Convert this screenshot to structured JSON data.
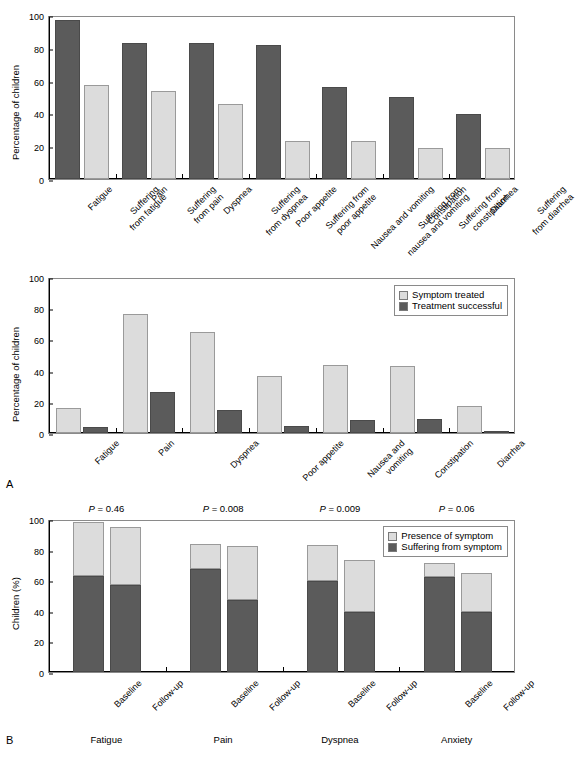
{
  "figure": {
    "panel_a_letter": "A",
    "panel_b_letter": "B"
  },
  "chart_data": [
    {
      "id": "chart-top",
      "type": "bar",
      "title": "",
      "xlabel": "",
      "ylabel": "Percentage of children",
      "ylim": [
        0,
        100
      ],
      "yticks": [
        0,
        20,
        40,
        60,
        80,
        100
      ],
      "grid": false,
      "legend": "none",
      "groups": [
        {
          "name": "Fatigue",
          "bars": [
            {
              "label": "Fatigue",
              "value": 97,
              "style": "dark"
            },
            {
              "label": "Suffering\nfrom fatigue",
              "value": 57.5,
              "style": "light"
            }
          ]
        },
        {
          "name": "Pain",
          "bars": [
            {
              "label": "Pain",
              "value": 83,
              "style": "dark"
            },
            {
              "label": "Suffering\nfrom pain",
              "value": 53.5,
              "style": "light"
            }
          ]
        },
        {
          "name": "Dyspnea",
          "bars": [
            {
              "label": "Dyspnea",
              "value": 83,
              "style": "dark"
            },
            {
              "label": "Suffering\nfrom dyspnea",
              "value": 46,
              "style": "light"
            }
          ]
        },
        {
          "name": "Poor appetite",
          "bars": [
            {
              "label": "Poor appetite",
              "value": 82,
              "style": "dark"
            },
            {
              "label": "Suffering from\npoor appetite",
              "value": 23,
              "style": "light"
            }
          ]
        },
        {
          "name": "Nausea and vomiting",
          "bars": [
            {
              "label": "Nausea and vomiting",
              "value": 56,
              "style": "dark"
            },
            {
              "label": "Suffering from\nnausea and vomiting",
              "value": 23,
              "style": "light"
            }
          ]
        },
        {
          "name": "Constipation",
          "bars": [
            {
              "label": "Constipation",
              "value": 50,
              "style": "dark"
            },
            {
              "label": "Suffering from\nconstipation",
              "value": 19,
              "style": "light"
            }
          ]
        },
        {
          "name": "Diarrhea",
          "bars": [
            {
              "label": "Diarrhea",
              "value": 39.5,
              "style": "dark"
            },
            {
              "label": "Suffering\nfrom diarrhea",
              "value": 19,
              "style": "light"
            }
          ]
        }
      ]
    },
    {
      "id": "chart-middle",
      "type": "bar",
      "title": "",
      "xlabel": "",
      "ylabel": "Percentage of children",
      "ylim": [
        0,
        100
      ],
      "yticks": [
        0,
        20,
        40,
        60,
        80,
        100
      ],
      "grid": false,
      "legend_position": "top-right",
      "legend": [
        {
          "name": "Symptom treated",
          "style": "light"
        },
        {
          "name": "Treatment successful",
          "style": "dark"
        }
      ],
      "categories": [
        "Fatigue",
        "Pain",
        "Dyspnea",
        "Poor appetite",
        "Nausea and\nvomiting",
        "Constipation",
        "Diarrhea"
      ],
      "series": [
        {
          "name": "Symptom treated",
          "style": "light",
          "values": [
            16,
            76,
            65,
            36.5,
            43.5,
            43,
            17
          ]
        },
        {
          "name": "Treatment successful",
          "style": "dark",
          "values": [
            4,
            26.5,
            15,
            4.5,
            8.5,
            9,
            0.5
          ]
        }
      ]
    },
    {
      "id": "chart-bottom",
      "type": "bar",
      "subtype": "stacked",
      "title": "",
      "xlabel": "",
      "ylabel": "Children (%)",
      "ylim": [
        0,
        100
      ],
      "yticks": [
        0,
        20,
        40,
        60,
        80,
        100
      ],
      "grid": false,
      "legend_position": "top-right",
      "legend": [
        {
          "name": "Presence of symptom",
          "style": "light"
        },
        {
          "name": "Suffering from symptom",
          "style": "dark"
        }
      ],
      "group_labels": [
        "Fatigue",
        "Pain",
        "Dyspnea",
        "Anxiety"
      ],
      "annotations": [
        {
          "text": "P = 0.46",
          "group": "Fatigue"
        },
        {
          "text": "P = 0.008",
          "group": "Pain"
        },
        {
          "text": "P = 0.009",
          "group": "Dyspnea"
        },
        {
          "text": "P = 0.06",
          "group": "Anxiety"
        }
      ],
      "bar_labels": [
        "Baseline",
        "Follow-up"
      ],
      "groups": [
        {
          "name": "Fatigue",
          "bars": [
            {
              "label": "Baseline",
              "total": 98,
              "suffering": 63
            },
            {
              "label": "Follow-up",
              "total": 94.5,
              "suffering": 57
            }
          ]
        },
        {
          "name": "Pain",
          "bars": [
            {
              "label": "Baseline",
              "total": 84,
              "suffering": 67.5
            },
            {
              "label": "Follow-up",
              "total": 82.5,
              "suffering": 47
            }
          ]
        },
        {
          "name": "Dyspnea",
          "bars": [
            {
              "label": "Baseline",
              "total": 83,
              "suffering": 59.5
            },
            {
              "label": "Follow-up",
              "total": 73.5,
              "suffering": 39
            }
          ]
        },
        {
          "name": "Anxiety",
          "bars": [
            {
              "label": "Baseline",
              "total": 71.5,
              "suffering": 62
            },
            {
              "label": "Follow-up",
              "total": 64.5,
              "suffering": 39
            }
          ]
        }
      ]
    }
  ]
}
